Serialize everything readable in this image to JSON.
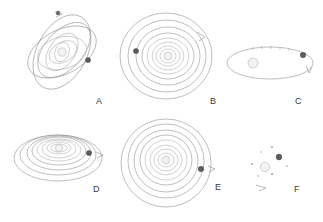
{
  "figure": {
    "width": 323,
    "height": 222,
    "background_color": "#ffffff",
    "line_color": "#8a8a8a",
    "marker_color": "#5c5c5c",
    "star_color": "#f2f2f2",
    "label_color": "#3a3a3a"
  },
  "panels": [
    {
      "id": "A",
      "label": "A",
      "description": "mutually inclined overlapping elliptical orbits",
      "center": {
        "x": 62,
        "y": 52
      },
      "label_pos": {
        "x": 96,
        "y": 104
      },
      "orbit_count": 7,
      "orbit_style": "inclined-ellipses",
      "has_star": true,
      "has_arrow": true,
      "marker_count": 2
    },
    {
      "id": "B",
      "label": "B",
      "description": "coplanar nested ellipses, moderate eccentricity",
      "center": {
        "x": 166,
        "y": 54
      },
      "label_pos": {
        "x": 210,
        "y": 104
      },
      "orbit_count": 9,
      "orbit_style": "nested-ellipses",
      "has_star": true,
      "has_arrow": true,
      "marker_count": 1
    },
    {
      "id": "C",
      "label": "C",
      "description": "single wide flattened orbit with offset star and tick marks",
      "center": {
        "x": 270,
        "y": 63
      },
      "label_pos": {
        "x": 295,
        "y": 104
      },
      "orbit_count": 1,
      "orbit_style": "single-flat-ellipse",
      "has_star": true,
      "has_arrow": true,
      "marker_count": 1
    },
    {
      "id": "D",
      "label": "D",
      "description": "strongly flattened nested ellipses seen near edge-on",
      "center": {
        "x": 58,
        "y": 155
      },
      "label_pos": {
        "x": 93,
        "y": 192
      },
      "orbit_count": 9,
      "orbit_style": "flattened-nested-ellipses",
      "has_star": true,
      "has_arrow": true,
      "marker_count": 1
    },
    {
      "id": "E",
      "label": "E",
      "description": "near-circular concentric orbits",
      "center": {
        "x": 166,
        "y": 160
      },
      "label_pos": {
        "x": 215,
        "y": 190
      },
      "orbit_count": 9,
      "orbit_style": "concentric-circles",
      "has_star": true,
      "has_arrow": true,
      "marker_count": 1
    },
    {
      "id": "F",
      "label": "F",
      "description": "scattered debris field with single star, planet and arc",
      "center": {
        "x": 268,
        "y": 168
      },
      "label_pos": {
        "x": 294,
        "y": 192
      },
      "orbit_count": 0,
      "orbit_style": "scattered-debris",
      "has_star": true,
      "has_arrow": true,
      "marker_count": 1,
      "debris_count": 6
    }
  ]
}
